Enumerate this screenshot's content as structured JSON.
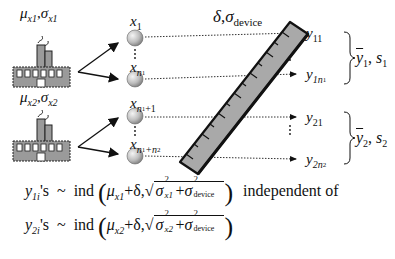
{
  "diagram": {
    "factory1": {
      "params": {
        "mu": "μ",
        "mu_sub": "x1",
        "sigma": "σ",
        "sigma_sub": "x1"
      }
    },
    "factory2": {
      "params": {
        "mu": "μ",
        "mu_sub": "x2",
        "sigma": "σ",
        "sigma_sub": "x2"
      }
    },
    "device_label": {
      "delta": "δ",
      "sigma": "σ",
      "sigma_sub": "device"
    },
    "samples": [
      {
        "base": "x",
        "sub": "1",
        "subsub": ""
      },
      {
        "base": "x",
        "sub": "n",
        "subsub": "1"
      },
      {
        "base": "x",
        "sub": "n",
        "subsub": "1",
        "extra": "+1"
      },
      {
        "base": "x",
        "sub": "n",
        "subsub": "1",
        "extra": "+n",
        "extra_sub": "2"
      }
    ],
    "measurements": [
      {
        "base": "y",
        "sub": "11",
        "subsub": ""
      },
      {
        "base": "y",
        "sub": "1n",
        "subsub": "1"
      },
      {
        "base": "y",
        "sub": "21",
        "subsub": ""
      },
      {
        "base": "y",
        "sub": "2n",
        "subsub": "2"
      }
    ],
    "summaries": [
      {
        "bar": "y",
        "bar_sub": "1",
        "s": "s",
        "s_sub": "1"
      },
      {
        "bar": "y",
        "bar_sub": "2",
        "s": "s",
        "s_sub": "2"
      }
    ],
    "dots": "⋮"
  },
  "formulas": [
    {
      "y": "y",
      "y_sub": "1i",
      "suffix": "'s",
      "tilde": "~",
      "ind": "ind",
      "mu": "μ",
      "mu_sub": "x1",
      "plus_delta": "+δ,",
      "sigma": "σ",
      "sigma_sub": "x1",
      "plus": "+",
      "sigma_dev_sub": "device",
      "sq": "2",
      "trailing": "independent of"
    },
    {
      "y": "y",
      "y_sub": "2i",
      "suffix": "'s",
      "tilde": "~",
      "ind": "ind",
      "mu": "μ",
      "mu_sub": "x2",
      "plus_delta": "+δ,",
      "sigma": "σ",
      "sigma_sub": "x2",
      "plus": "+",
      "sigma_dev_sub": "device",
      "sq": "2",
      "trailing": ""
    }
  ],
  "colors": {
    "ruler_fill": "#a9a9a9",
    "factory_fill": "#9a9a9a",
    "ball_light": "#f2f2f2",
    "ball_dark": "#8c8c8c",
    "ink": "#111111"
  }
}
